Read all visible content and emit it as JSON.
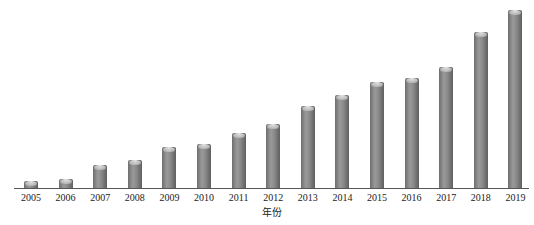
{
  "chart_data": {
    "type": "bar",
    "title": "",
    "xlabel": "年份",
    "ylabel": "",
    "categories": [
      "2005",
      "2006",
      "2007",
      "2008",
      "2009",
      "2010",
      "2011",
      "2012",
      "2013",
      "2014",
      "2015",
      "2016",
      "2017",
      "2018",
      "2019"
    ],
    "values": [
      7,
      9,
      23,
      28,
      41,
      44,
      55,
      64,
      82,
      93,
      106,
      110,
      121,
      156,
      178
    ],
    "value_note": "relative bar heights in pixels; no y-axis scale shown",
    "ylim": [
      0,
      180
    ],
    "grid": false,
    "legend": null,
    "bar_color": "#7f7f7f"
  }
}
